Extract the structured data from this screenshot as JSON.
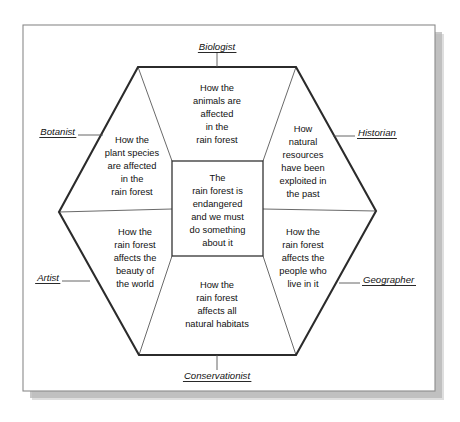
{
  "diagram": {
    "title_visible": false,
    "type": "hexagon-perspectives-wheel",
    "center": {
      "lines": [
        "The",
        "rain forest is",
        "endangered",
        "and we must",
        "do something",
        "about it"
      ]
    },
    "segments": [
      {
        "id": "top",
        "role": "Biologist",
        "lines": [
          "How the",
          "animals are",
          "affected",
          "in the",
          "rain forest"
        ]
      },
      {
        "id": "upper-left",
        "role": "Botanist",
        "lines": [
          "How the",
          "plant species",
          "are affected",
          "in the",
          "rain forest"
        ]
      },
      {
        "id": "upper-right",
        "role": "Historian",
        "lines": [
          "How",
          "natural",
          "resources",
          "have been",
          "exploited in",
          "the past"
        ]
      },
      {
        "id": "lower-left",
        "role": "Artist",
        "lines": [
          "How the",
          "rain forest",
          "affects the",
          "beauty of",
          "the world"
        ]
      },
      {
        "id": "lower-right",
        "role": "Geographer",
        "lines": [
          "How the",
          "rain forest",
          "affects the",
          "people who",
          "live in it"
        ]
      },
      {
        "id": "bottom",
        "role": "Conservationist",
        "lines": [
          "How the",
          "rain forest",
          "affects all",
          "natural habitats"
        ]
      }
    ],
    "colors": {
      "background": "#ffffff",
      "hexagon_stroke": "#2b2b2b",
      "spoke_stroke": "#6a6a6a",
      "text": "#111111",
      "frame_stroke": "#8a8a8a",
      "shadow": "#9a9a9a"
    }
  }
}
